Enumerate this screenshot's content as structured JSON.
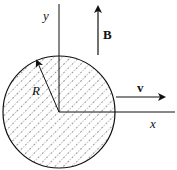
{
  "diagram": {
    "labels": {
      "y_axis": "y",
      "x_axis": "x",
      "field": "B",
      "velocity": "v",
      "radius": "R"
    },
    "colors": {
      "stroke": "#111111",
      "hatch": "#333333",
      "background": "#ffffff"
    },
    "geometry": {
      "circle_center": [
        59,
        112
      ],
      "circle_radius": 56
    }
  }
}
